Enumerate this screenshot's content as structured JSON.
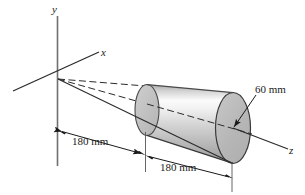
{
  "figure": {
    "background_color": "#ffffff",
    "line_color": "#1a1a1a",
    "axes": [
      {
        "name": "y",
        "label": "y"
      },
      {
        "name": "x",
        "label": "x"
      },
      {
        "name": "z",
        "label": "z"
      }
    ],
    "dimensions": [
      {
        "name": "apex-to-small-end",
        "label": "180 mm",
        "value": 180,
        "unit": "mm"
      },
      {
        "name": "frustum-length",
        "label": "180 mm",
        "value": 180,
        "unit": "mm"
      },
      {
        "name": "large-end-radius",
        "label": "60 mm",
        "value": 60,
        "unit": "mm"
      }
    ],
    "solid": {
      "name": "frustum",
      "shade_light": "#fcfcfc",
      "shade_mid": "#c9c9c9",
      "shade_dark": "#9a9a9a",
      "end_cap_fill": "#b9b9b9"
    }
  }
}
